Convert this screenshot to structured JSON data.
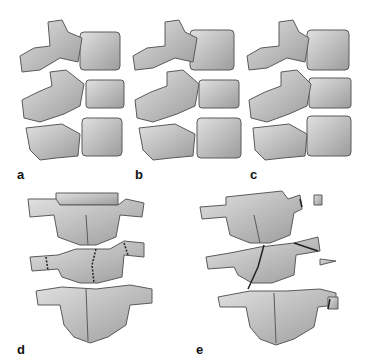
{
  "figure": {
    "panels": [
      {
        "id": "a",
        "label": "a",
        "view": "lateral",
        "description": "intact lumbar segment, lateral view"
      },
      {
        "id": "b",
        "label": "b",
        "view": "lateral",
        "description": "lateral view, narrowed disc space"
      },
      {
        "id": "c",
        "label": "c",
        "view": "lateral",
        "description": "lateral view"
      },
      {
        "id": "d",
        "label": "d",
        "view": "posterior",
        "description": "posterior view with fractures of transverse process and lamina"
      },
      {
        "id": "e",
        "label": "e",
        "view": "posterior",
        "description": "posterior view with multiple fractures and displaced fragments"
      }
    ]
  },
  "colors": {
    "bone_fill": "#c8c8c8",
    "bone_shade": "#9a9a9a",
    "outline": "#5a5a5a",
    "fracture": "#222222"
  }
}
